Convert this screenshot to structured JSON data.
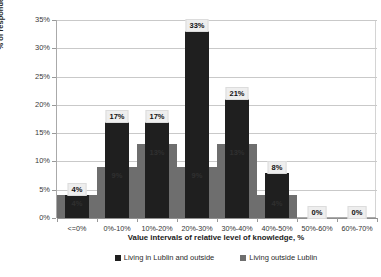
{
  "chart_data": {
    "type": "bar",
    "title": "",
    "xlabel": "Value intervals of relative level of knowledge, %",
    "ylabel": "% of respondents",
    "categories": [
      "<=0%",
      "0%-10%",
      "10%-20%",
      "20%-30%",
      "30%-40%",
      "40%-50%",
      "50%-60%",
      "60%-70%"
    ],
    "series": [
      {
        "name": "Living in Lublin and outside",
        "color": "#1f1f1f",
        "values": [
          4,
          17,
          17,
          33,
          21,
          8,
          0,
          0
        ],
        "labels": [
          "4%",
          "17%",
          "17%",
          "33%",
          "21%",
          "8%",
          "0%",
          "0%"
        ]
      },
      {
        "name": "Living outside Lublin",
        "color": "#6e6e6e",
        "values": [
          4,
          9,
          13,
          9,
          13,
          4,
          0,
          0
        ],
        "labels": [
          "4%",
          "9%",
          "13%",
          "9%",
          "13%",
          "4%",
          "0%",
          "0%"
        ]
      }
    ],
    "ylim": [
      0,
      35
    ],
    "yticks": [
      "0%",
      "5%",
      "10%",
      "15%",
      "20%",
      "25%",
      "30%",
      "35%"
    ],
    "ytick_values": [
      0,
      5,
      10,
      15,
      20,
      25,
      30,
      35
    ],
    "grid": true,
    "legend_position": "bottom"
  },
  "axes": {
    "y_title": "% of respondents",
    "x_title": "Value intervals of relative level of knowledge, %"
  }
}
